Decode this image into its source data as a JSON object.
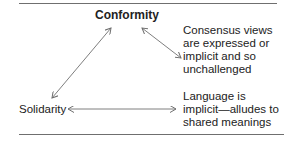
{
  "diagram": {
    "nodes": {
      "conformity": "Conformity",
      "solidarity": "Solidarity"
    },
    "notes": {
      "consensus": {
        "lines": [
          "Consensus views",
          "are expressed or",
          "implicit and so",
          "unchallenged"
        ]
      },
      "language": {
        "lines": [
          "Language is",
          "implicit—alludes to",
          "shared meanings"
        ]
      }
    },
    "edges": [
      {
        "from": "solidarity",
        "to": "conformity",
        "type": "bidirectional"
      },
      {
        "from": "conformity",
        "to": "consensus-note",
        "type": "bidirectional"
      },
      {
        "from": "solidarity",
        "to": "language-note",
        "type": "bidirectional"
      }
    ],
    "colors": {
      "text": "#222222",
      "lines": "#6f6f6f"
    }
  }
}
